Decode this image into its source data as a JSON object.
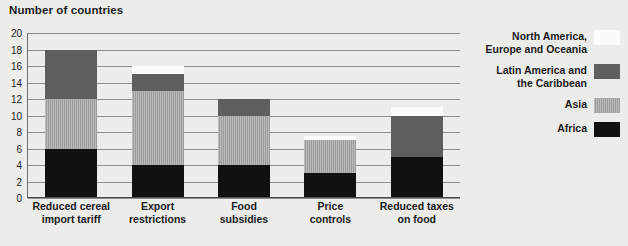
{
  "chart_data": {
    "type": "bar",
    "title": "Number of countries",
    "xlabel": "",
    "ylabel": "",
    "ylim": [
      0,
      20
    ],
    "ytick_step": 2,
    "yticks": [
      0,
      2,
      4,
      6,
      8,
      10,
      12,
      14,
      16,
      18,
      20
    ],
    "grid": true,
    "stacked": true,
    "legend_position": "right",
    "categories": [
      "Reduced cereal import tariff",
      "Export restrictions",
      "Food subsidies",
      "Price controls",
      "Reduced taxes on food"
    ],
    "category_lines": [
      [
        "Reduced cereal",
        "import tariff"
      ],
      [
        "Export",
        "restrictions"
      ],
      [
        "Food",
        "subsidies"
      ],
      [
        "Price",
        "controls"
      ],
      [
        "Reduced taxes",
        "on food"
      ]
    ],
    "series": [
      {
        "name": "Africa",
        "color": "#111111",
        "values": [
          6,
          4,
          4,
          3,
          5
        ]
      },
      {
        "name": "Asia",
        "color": "#9c9c9c",
        "values": [
          6,
          9,
          6,
          4,
          0
        ]
      },
      {
        "name": "Latin America and the Caribbean",
        "color": "#5e5e5e",
        "values": [
          6,
          2,
          2,
          0,
          5
        ]
      },
      {
        "name": "North America, Europe and Oceania",
        "color": "#fbfbf9",
        "values": [
          0,
          1,
          0,
          0.5,
          1
        ]
      }
    ],
    "totals": [
      18,
      16,
      12,
      7.5,
      11
    ]
  },
  "legend": {
    "items": [
      {
        "label": "North America, Europe and Oceania",
        "swatch": "north-america-swatch"
      },
      {
        "label": "Latin America and the Caribbean",
        "swatch": "latin-america-swatch"
      },
      {
        "label": "Asia",
        "swatch": "asia-swatch"
      },
      {
        "label": "Africa",
        "swatch": "africa-swatch"
      }
    ]
  },
  "colors": {
    "background": "#ececeb",
    "gridline": "#8e8e8e",
    "axis": "#4a4a4a",
    "text": "#1b1b1b"
  }
}
